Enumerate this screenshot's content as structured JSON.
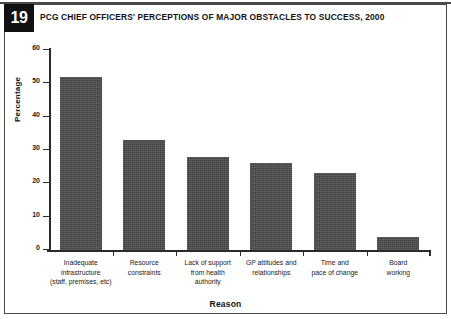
{
  "figure": {
    "number": "19",
    "title": "PCG CHIEF OFFICERS' PERCEPTIONS OF MAJOR OBSTACLES TO SUCCESS, 2000",
    "badge_bg": "#111111",
    "bar_color": "#4b4b4b",
    "axis_color": "#2b2b2b",
    "frame_color": "#4a4a4a"
  },
  "chart_data": {
    "type": "bar",
    "title": "PCG CHIEF OFFICERS' PERCEPTIONS OF MAJOR OBSTACLES TO SUCCESS, 2000",
    "xlabel": "Reason",
    "ylabel": "Percentage",
    "ylim": [
      0,
      60
    ],
    "yticks": [
      0,
      10,
      20,
      30,
      40,
      50,
      60
    ],
    "ytick_labels": [
      "0",
      "10",
      "20",
      "30",
      "40",
      "50",
      "60"
    ],
    "grid": false,
    "legend": null,
    "categories": [
      "Inadequate\ninfrastructure\n(staff, premises, etc)",
      "Resource\nconstraints",
      "Lack of support\nfrom health\nauthority",
      "GP attitudes and\nrelationships",
      "Time and\npace of change",
      "Board\nworking"
    ],
    "values": [
      52,
      33,
      28,
      26,
      23,
      4
    ]
  }
}
